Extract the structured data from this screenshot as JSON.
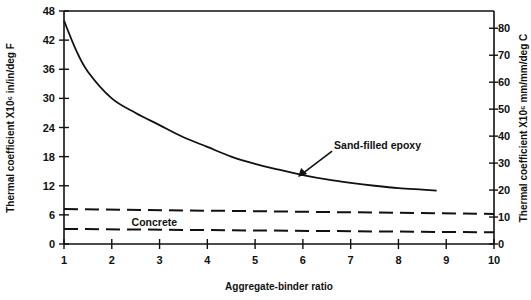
{
  "chart_data": {
    "type": "line",
    "title": "",
    "xlabel": "Aggregate-binder ratio",
    "ylabel": "Thermal coefficient X10⁶ in/in/deg F",
    "y2label": "Thermal coefficient X10⁶ mm/mm/deg C",
    "xlim": [
      1,
      10
    ],
    "ylim": [
      0,
      48
    ],
    "y2lim": [
      0,
      86.4
    ],
    "x_ticks": [
      "1",
      "2",
      "3",
      "4",
      "5",
      "6",
      "7",
      "8",
      "9",
      "10"
    ],
    "y_ticks": [
      "0",
      "6",
      "12",
      "18",
      "24",
      "30",
      "36",
      "42",
      "48"
    ],
    "y2_ticks": [
      "0",
      "10",
      "20",
      "30",
      "40",
      "50",
      "60",
      "70",
      "80"
    ],
    "grid": false,
    "series": [
      {
        "name": "Sand-filled epoxy",
        "style": "solid",
        "x": [
          1.0,
          1.25,
          1.5,
          2.0,
          2.5,
          3.0,
          3.5,
          4.0,
          4.5,
          5.0,
          5.5,
          6.0,
          6.5,
          7.0,
          7.5,
          8.0,
          8.5,
          8.8
        ],
        "values": [
          46,
          40,
          35.5,
          30,
          27,
          24.5,
          22,
          20,
          18,
          16.5,
          15.3,
          14.2,
          13.3,
          12.6,
          12.0,
          11.5,
          11.2,
          11.0
        ]
      },
      {
        "name": "Concrete (upper bound)",
        "style": "dashed",
        "x": [
          1,
          10
        ],
        "values": [
          7.2,
          6.2
        ]
      },
      {
        "name": "Concrete (lower bound)",
        "style": "dashed",
        "x": [
          1,
          10
        ],
        "values": [
          3.1,
          2.4
        ]
      }
    ],
    "annotations": [
      {
        "text": "Sand-filled epoxy",
        "arrow_to_x": 5.9,
        "arrow_to_y": 13.8
      },
      {
        "text": "Concrete",
        "x": 3.0,
        "y": 4.6
      }
    ]
  }
}
